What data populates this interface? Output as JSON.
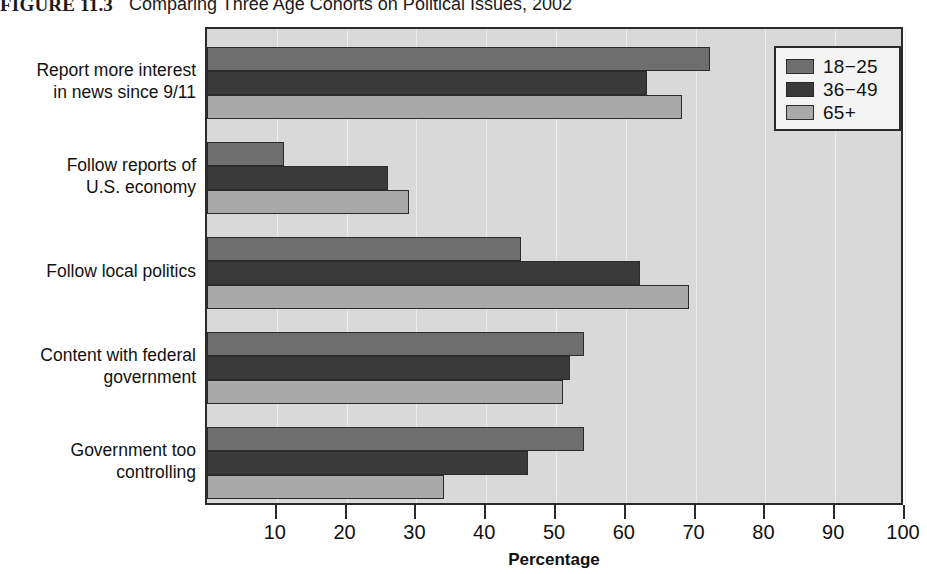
{
  "figure": {
    "label": "FIGURE 11.3",
    "caption": "Comparing Three Age Cohorts on Political Issues, 2002"
  },
  "colors": {
    "series_18_25": "#6e6e6e",
    "series_36_49": "#3a3a3a",
    "series_65_plus": "#a9a9a9",
    "plot_background": "#d9d9d9",
    "axis": "#2b2b2b",
    "legend_background": "#f4f4f4"
  },
  "chart_data": {
    "type": "bar",
    "orientation": "horizontal",
    "title": "Comparing Three Age Cohorts on Political Issues, 2002",
    "xlabel": "Percentage",
    "ylabel": "",
    "xlim": [
      0,
      100
    ],
    "xticks": [
      10,
      20,
      30,
      40,
      50,
      60,
      70,
      80,
      90,
      100
    ],
    "grid": true,
    "legend_position": "top-right",
    "categories": [
      "Report more interest in news since 9/11",
      "Follow reports of U.S. economy",
      "Follow local politics",
      "Content with federal government",
      "Government too controlling"
    ],
    "category_lines": [
      [
        "Report more interest",
        "in news since 9/11"
      ],
      [
        "Follow reports of",
        "U.S. economy"
      ],
      [
        "Follow local politics"
      ],
      [
        "Content with federal",
        "government"
      ],
      [
        "Government too",
        "controlling"
      ]
    ],
    "series": [
      {
        "name": "18−25",
        "color": "#6e6e6e",
        "values": [
          72,
          11,
          45,
          54,
          54
        ]
      },
      {
        "name": "36−49",
        "color": "#3a3a3a",
        "values": [
          63,
          26,
          62,
          52,
          46
        ]
      },
      {
        "name": "65+",
        "color": "#a9a9a9",
        "values": [
          68,
          29,
          69,
          51,
          34
        ]
      }
    ]
  },
  "legend": {
    "entries": [
      {
        "label": "18−25"
      },
      {
        "label": "36−49"
      },
      {
        "label": "65+"
      }
    ]
  },
  "x_axis": {
    "title": "Percentage",
    "ticks": [
      "10",
      "20",
      "30",
      "40",
      "50",
      "60",
      "70",
      "80",
      "90",
      "100"
    ]
  }
}
